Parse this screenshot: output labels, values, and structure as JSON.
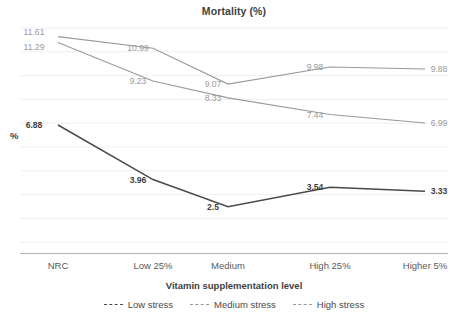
{
  "chart_data": {
    "type": "line",
    "title": "Mortality (%)",
    "xlabel": "Vitamin supplementation level",
    "ylabel": "%",
    "categories": [
      "NRC",
      "Low 25%",
      "Medium",
      "High 25%",
      "Higher 5%"
    ],
    "ylim": [
      0,
      12.5
    ],
    "grid": true,
    "legend_position": "bottom",
    "series": [
      {
        "name": "Low stress",
        "color": "#4a4a4a",
        "values": [
          6.88,
          3.96,
          2.5,
          3.54,
          3.33
        ],
        "labels": [
          "6.88",
          "3.96",
          "2.5",
          "3.54",
          "3.33"
        ]
      },
      {
        "name": "Medium stress",
        "color": "#9a9a9a",
        "values": [
          11.29,
          9.23,
          8.33,
          7.44,
          6.99
        ],
        "labels": [
          "11.29",
          "9.23",
          "8.33",
          "7.44",
          "6.99"
        ]
      },
      {
        "name": "High stress",
        "color": "#9a9a9a",
        "values": [
          11.61,
          10.99,
          9.07,
          9.98,
          9.88
        ],
        "labels": [
          "11.61",
          "10.99",
          "9.07",
          "9.98",
          "9.88"
        ]
      }
    ]
  },
  "legend": {
    "items": [
      {
        "label": "Low stress"
      },
      {
        "label": "Medium stress"
      },
      {
        "label": "High stress"
      }
    ]
  },
  "axis": {
    "x_title": "Vitamin supplementation level",
    "y_title": "%",
    "tick_0": "NRC",
    "tick_1": "Low 25%",
    "tick_2": "Medium",
    "tick_3": "High 25%",
    "tick_4": "Higher 5%"
  },
  "title": "Mortality (%)"
}
